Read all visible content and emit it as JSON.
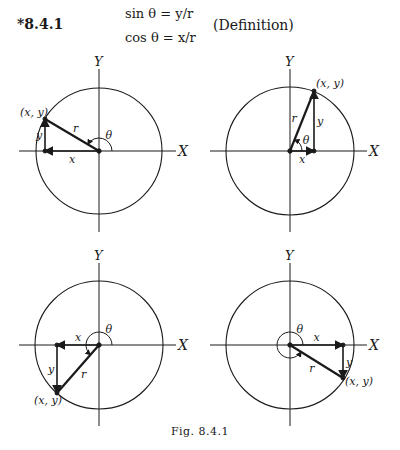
{
  "equation": {
    "number": "*8.4.1",
    "sin_line": "sin θ = y/r",
    "cos_line": "cos θ = x/r",
    "note": "(Definition)"
  },
  "labels": {
    "x_axis": "X",
    "y_axis": "Y",
    "point": "(x, y)",
    "radius": "r",
    "x_leg": "x",
    "y_leg": "y",
    "angle": "θ"
  },
  "panels": [
    {
      "id": "quadrant-2",
      "position": "top-left",
      "center": [
        99,
        151
      ],
      "radius": 63,
      "point": [
        45,
        119
      ]
    },
    {
      "id": "quadrant-1",
      "position": "top-right",
      "center": [
        290,
        151
      ],
      "radius": 64,
      "point": [
        314,
        91
      ]
    },
    {
      "id": "quadrant-3",
      "position": "bottom-left",
      "center": [
        99,
        345
      ],
      "radius": 64,
      "point": [
        57,
        393
      ]
    },
    {
      "id": "quadrant-4",
      "position": "bottom-right",
      "center": [
        290,
        345
      ],
      "radius": 64,
      "point": [
        343,
        378
      ]
    }
  ],
  "caption": "Fig. 8.4.1"
}
